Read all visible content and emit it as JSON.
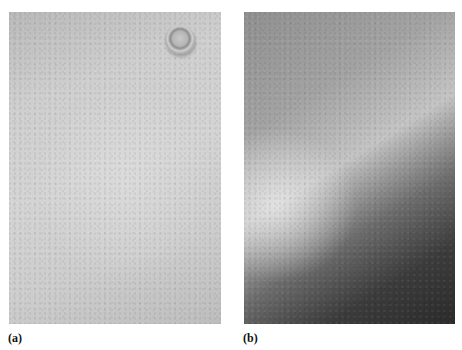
{
  "figure": {
    "panels": [
      {
        "label": "(a)",
        "content": "skin-surface-photo-with-navel",
        "tone": "light-gray"
      },
      {
        "label": "(b)",
        "content": "skin-surface-photo-diagonal-shading",
        "tone": "light-to-dark-gray"
      }
    ]
  }
}
